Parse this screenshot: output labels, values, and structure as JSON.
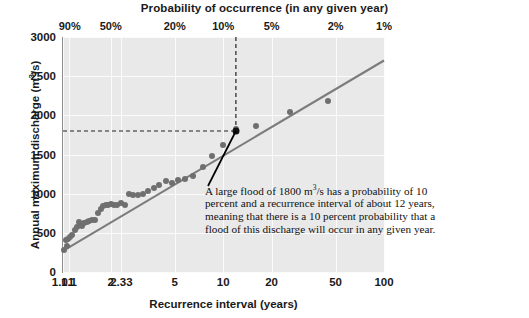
{
  "chart_data": {
    "type": "scatter",
    "title": "",
    "top_axis_label": "Probability of occurrence (in any given year)",
    "xlabel": "Recurrence interval (years)",
    "ylabel_text": "Annual maximum discharge (m",
    "ylabel_sup": "3",
    "ylabel_tail": "/s)",
    "ylabel_full": "Annual maximum discharge (m3/s)",
    "xscale": "log",
    "xlim": [
      1.01,
      100
    ],
    "ylim": [
      0,
      3000
    ],
    "grid": true,
    "legend": "none",
    "x_ticks": [
      "1.01",
      "1.1",
      "2",
      "2.33",
      "5",
      "10",
      "20",
      "50",
      "100"
    ],
    "x_tick_values": [
      1.01,
      1.1,
      2,
      2.33,
      5,
      10,
      20,
      50,
      100
    ],
    "top_ticks": [
      "90%",
      "50%",
      "20%",
      "10%",
      "5%",
      "2%",
      "1%"
    ],
    "top_tick_values": [
      1.111,
      2,
      5,
      10,
      20,
      50,
      100
    ],
    "y_ticks": [
      "0",
      "500",
      "1000",
      "1500",
      "2000",
      "2500",
      "3000"
    ],
    "y_tick_values": [
      0,
      500,
      1000,
      1500,
      2000,
      2500,
      3000
    ],
    "series": [
      {
        "name": "Annual maximum discharge observations",
        "marker": "circle",
        "color": "#6f6f6f",
        "points": [
          [
            1.03,
            280
          ],
          [
            1.05,
            410
          ],
          [
            1.07,
            330
          ],
          [
            1.09,
            425
          ],
          [
            1.12,
            445
          ],
          [
            1.15,
            470
          ],
          [
            1.19,
            540
          ],
          [
            1.23,
            570
          ],
          [
            1.27,
            640
          ],
          [
            1.29,
            600
          ],
          [
            1.33,
            590
          ],
          [
            1.37,
            625
          ],
          [
            1.42,
            645
          ],
          [
            1.47,
            650
          ],
          [
            1.53,
            665
          ],
          [
            1.6,
            670
          ],
          [
            1.67,
            760
          ],
          [
            1.74,
            800
          ],
          [
            1.8,
            840
          ],
          [
            1.86,
            855
          ],
          [
            1.92,
            860
          ],
          [
            2.0,
            865
          ],
          [
            2.1,
            855
          ],
          [
            2.2,
            860
          ],
          [
            2.33,
            880
          ],
          [
            2.45,
            855
          ],
          [
            2.6,
            1000
          ],
          [
            2.75,
            985
          ],
          [
            2.95,
            980
          ],
          [
            3.15,
            1000
          ],
          [
            3.4,
            1035
          ],
          [
            3.7,
            1075
          ],
          [
            4.0,
            1105
          ],
          [
            4.4,
            1160
          ],
          [
            4.8,
            1135
          ],
          [
            5.2,
            1170
          ],
          [
            5.8,
            1190
          ],
          [
            6.5,
            1230
          ],
          [
            7.5,
            1340
          ],
          [
            8.5,
            1480
          ],
          [
            10.0,
            1620
          ],
          [
            12.0,
            1820
          ],
          [
            16.0,
            1870
          ],
          [
            26.0,
            2040
          ],
          [
            45.0,
            2190
          ]
        ]
      }
    ],
    "trend_line": {
      "name": "best-fit line",
      "color": "#7c7c7c",
      "start": [
        1.01,
        270
      ],
      "end": [
        100,
        2700
      ]
    },
    "reference_lines": [
      {
        "name": "discharge-1800",
        "orientation": "horizontal",
        "value": 1800,
        "style": "dashed",
        "color": "#222222"
      },
      {
        "name": "recurrence-12",
        "orientation": "vertical",
        "value": 12,
        "style": "dashed",
        "color": "#222222"
      }
    ],
    "marker_point": {
      "name": "flood-1800-marker",
      "x": 12,
      "y": 1800,
      "color": "#111111"
    },
    "annotation": {
      "text_part1": "A large flood of 1800 m",
      "text_sup": "3",
      "text_part2": "/s has a probability of 10 percent and a recurrence interval of about 12 years, meaning that there is a 10 percent probability that a flood of this discharge will occur in any given year.",
      "full_text": "A large flood of 1800 m3/s has a probability of 10 percent and a recurrence interval of about 12 years, meaning that there is a 10 percent probability that a flood of this discharge will occur in any given year."
    },
    "colors": {
      "plot_background": "#e9e9e9",
      "gridlines": "#fbfbfb",
      "axis": "#8d8d8d",
      "points": "#6f6f6f",
      "trend": "#7c7c7c",
      "reference": "#222222",
      "text": "#1a1a1a"
    }
  }
}
